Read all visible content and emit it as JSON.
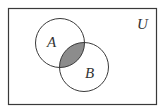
{
  "diagram": {
    "type": "venn",
    "universe_label": "U",
    "sets": [
      {
        "label": "A"
      },
      {
        "label": "B"
      }
    ],
    "shaded_region": "A ∩ B",
    "colors": {
      "stroke": "#3a3a3a",
      "shade": "#8c8c8c",
      "background": "#ffffff"
    }
  }
}
